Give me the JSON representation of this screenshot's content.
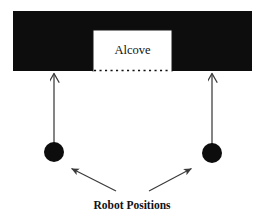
{
  "diagram": {
    "background_color": "#ffffff",
    "wall": {
      "name": "wall-band",
      "color": "#0d0d0d",
      "x": 13,
      "y": 11,
      "width": 239,
      "height": 60
    },
    "alcove": {
      "label": "Alcove",
      "fill_color": "#ffffff",
      "border_color": "#000000",
      "x": 93,
      "y": 30,
      "width": 79,
      "height": 41,
      "opening_style": "dotted"
    },
    "robots": [
      {
        "name": "robot-left",
        "cx": 54,
        "cy": 152,
        "r": 10,
        "color": "#0d0d0d"
      },
      {
        "name": "robot-right",
        "cx": 212,
        "cy": 153,
        "r": 10,
        "color": "#0d0d0d"
      }
    ],
    "sight_arrows": [
      {
        "name": "sight-arrow-left",
        "from_x": 54,
        "from_y": 143,
        "to_x": 54,
        "to_y": 72,
        "color": "#3a3a3a"
      },
      {
        "name": "sight-arrow-right",
        "from_x": 212,
        "from_y": 144,
        "to_x": 212,
        "to_y": 72,
        "color": "#3a3a3a"
      }
    ],
    "pointer_arrows": [
      {
        "name": "pointer-arrow-left",
        "from_x": 116,
        "from_y": 191,
        "to_x": 70,
        "to_y": 168,
        "color": "#3a3a3a"
      },
      {
        "name": "pointer-arrow-right",
        "from_x": 149,
        "from_y": 191,
        "to_x": 193,
        "to_y": 168,
        "color": "#3a3a3a"
      }
    ],
    "caption": {
      "text": "Robot Positions",
      "x": 132,
      "y": 209,
      "color": "#111111"
    }
  }
}
